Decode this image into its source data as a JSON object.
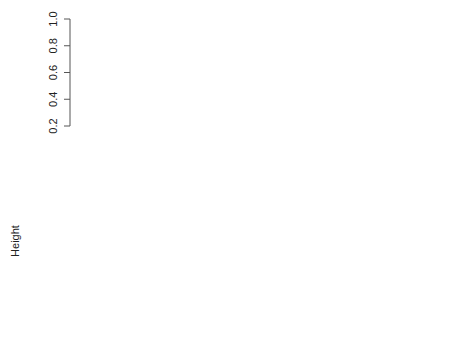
{
  "chart_data": {
    "type": "dendrogram",
    "title": "",
    "ylabel": "Height",
    "xlabel": "",
    "ylim": [
      0.2,
      1.0
    ],
    "yticks": [
      "0.2",
      "0.4",
      "0.6",
      "0.8",
      "1.0"
    ],
    "leaves": [
      {
        "gene": "TFC5",
        "category": "Transcription Initiation"
      },
      {
        "gene": "MRP49",
        "category": "Protein Biosynthesis"
      },
      {
        "gene": "RAD9",
        "category": "DNA Repair"
      },
      {
        "gene": "PRB1",
        "category": "Unknown"
      },
      {
        "gene": "DPB2",
        "category": "Nucleotide Excision Repair"
      },
      {
        "gene": "TFC4",
        "category": "Transcription Initiation"
      },
      {
        "gene": "MSH6",
        "category": "DNA Repair"
      },
      {
        "gene": "MRPL25",
        "category": "Protein Biosynthesis"
      },
      {
        "gene": "DIN7",
        "category": "DNA Repair"
      },
      {
        "gene": "CDC21",
        "category": "DNA Replication"
      },
      {
        "gene": "POL30",
        "category": "Nucleotide Excision Repair"
      },
      {
        "gene": "MSN2",
        "category": "Stress Response"
      },
      {
        "gene": "MTD1",
        "category": "Unknown"
      },
      {
        "gene": "PET122",
        "category": "Protein Biosynthesis"
      },
      {
        "gene": "TSA1",
        "category": "Stress Response"
      }
    ],
    "nodes": [
      {
        "label": "574",
        "height": 0.43,
        "children": [
          "TFC5",
          "node-613",
          "RAD9"
        ]
      },
      {
        "label": "613",
        "height": 0.39,
        "children": [
          "MRP49",
          "PRB1",
          "DPB2",
          "TFC4",
          "MSH6",
          "MRPL25",
          "DIN7",
          "CDC21",
          "POL30"
        ]
      },
      {
        "label": "740",
        "height": 0.27,
        "children": [
          "MSN2",
          "MTD1"
        ]
      },
      {
        "label": "508",
        "height": 0.5,
        "children": [
          "node-740",
          "PET122",
          "TSA1"
        ]
      },
      {
        "label": "",
        "height": 1.0,
        "children": [
          "node-574",
          "node-508"
        ]
      }
    ]
  }
}
